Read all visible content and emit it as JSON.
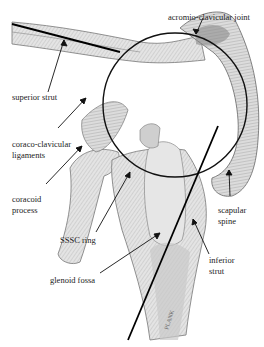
{
  "figure": {
    "type": "anatomical illustration",
    "signature": "PLANK"
  },
  "labels": {
    "acromio_clavicular_joint": "acromio-clavicular joint",
    "superior_strut": "superior strut",
    "coraco_clavicular_ligaments_line1": "coraco-clavicular",
    "coraco_clavicular_ligaments_line2": "ligaments",
    "coracoid_process_line1": "coracoid",
    "coracoid_process_line2": "process",
    "sssc_ring": "SSSC ring",
    "scapular_spine_line1": "scapular",
    "scapular_spine_line2": "spine",
    "glenoid_fossa": "glenoid fossa",
    "inferior_strut_line1": "inferior",
    "inferior_strut_line2": "strut"
  },
  "colors": {
    "bone_fill": "#d9d9d9",
    "bone_shade": "#a8a8a8",
    "outline": "#555555",
    "strut_line": "#000000",
    "text": "#222222"
  }
}
